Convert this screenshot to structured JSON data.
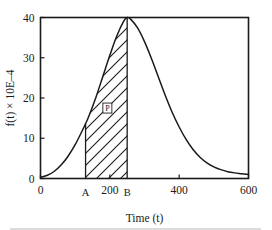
{
  "chart_data": {
    "type": "line",
    "title": "",
    "subtitle": "",
    "xlabel": "Time (t)",
    "ylabel": "f(t) × 10E–4",
    "xlim": [
      0,
      600
    ],
    "ylim": [
      0,
      40
    ],
    "grid": false,
    "legend": null,
    "x_ticks": [
      0,
      200,
      400,
      600
    ],
    "x_tick_labels": [
      "0",
      "200",
      "400",
      "600"
    ],
    "y_ticks": [
      0,
      10,
      20,
      30,
      40
    ],
    "y_tick_labels": [
      "0",
      "10",
      "20",
      "30",
      "40"
    ],
    "curve_description": "Skewed bell-shaped probability density curve rising from 0 at t=0 to a peak of 40 at t=250 then decaying back toward 0 near t=600",
    "series": [
      {
        "name": "f(t)",
        "x": [
          0,
          20,
          40,
          60,
          80,
          100,
          120,
          130,
          140,
          160,
          180,
          200,
          220,
          240,
          250,
          260,
          280,
          300,
          320,
          340,
          360,
          380,
          400,
          420,
          440,
          460,
          480,
          500,
          520,
          540,
          560,
          580,
          600
        ],
        "y": [
          0.3,
          0.8,
          1.8,
          3.4,
          5.6,
          8.4,
          11.8,
          13.6,
          15.6,
          20.2,
          25.4,
          30.6,
          35.4,
          39.1,
          40.0,
          39.6,
          37.4,
          34.0,
          29.8,
          25.2,
          20.6,
          16.4,
          12.8,
          9.7,
          7.2,
          5.3,
          3.9,
          2.9,
          2.2,
          1.7,
          1.4,
          1.2,
          1.0
        ]
      }
    ],
    "annotations": [
      {
        "name": "shaded-region",
        "label": "P",
        "type": "hatched-area",
        "from_x": 130,
        "to_x": 250,
        "description": "Area under the curve between boundary A and boundary B, filled with diagonal hatching, labelled P"
      },
      {
        "name": "boundary-a",
        "label": "A",
        "type": "vertical-line",
        "x": 130,
        "y_top": 13.6
      },
      {
        "name": "boundary-b",
        "label": "B",
        "type": "vertical-line",
        "x": 250,
        "y_top": 40.0
      }
    ]
  },
  "axes": {
    "x_title": "Time (t)",
    "y_title": "f(t) × 10E–4",
    "x_tick_labels": [
      "0",
      "200",
      "400",
      "600"
    ],
    "y_tick_labels": [
      "0",
      "10",
      "20",
      "30",
      "40"
    ]
  },
  "marks": {
    "a_label": "A",
    "b_label": "B",
    "region_label": "P"
  },
  "colors": {
    "ink": "#1a1a1a",
    "background": "#ffffff",
    "rule": "#b9b9b9"
  }
}
